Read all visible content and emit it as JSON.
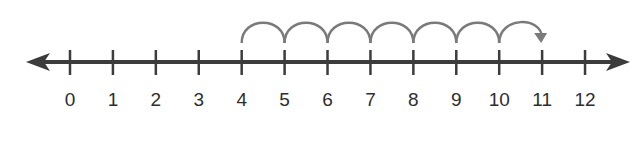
{
  "diagram": {
    "type": "number-line",
    "colors": {
      "axis": "#3c3c3c",
      "jumps": "#7a7a7a",
      "labels": "#2e2e2e"
    },
    "axis": {
      "min": 0,
      "max": 12,
      "arrows": "both"
    },
    "ticks": [
      {
        "value": 0,
        "label": "0"
      },
      {
        "value": 1,
        "label": "1"
      },
      {
        "value": 2,
        "label": "2"
      },
      {
        "value": 3,
        "label": "3"
      },
      {
        "value": 4,
        "label": "4"
      },
      {
        "value": 5,
        "label": "5"
      },
      {
        "value": 6,
        "label": "6"
      },
      {
        "value": 7,
        "label": "7"
      },
      {
        "value": 8,
        "label": "8"
      },
      {
        "value": 9,
        "label": "9"
      },
      {
        "value": 10,
        "label": "10"
      },
      {
        "value": 11,
        "label": "11"
      },
      {
        "value": 12,
        "label": "12"
      }
    ],
    "jumps": {
      "start": 4,
      "end": 11,
      "step": 1,
      "count": 7,
      "final_arrow": true
    }
  }
}
